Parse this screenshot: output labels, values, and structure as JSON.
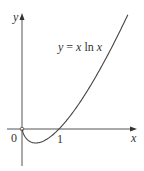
{
  "chart_data": {
    "type": "line",
    "title": "",
    "function_label": "y = x ln x",
    "xlabel": "x",
    "ylabel": "y",
    "x_ticks": [
      {
        "value": 0,
        "label": "0"
      },
      {
        "value": 1,
        "label": "1"
      }
    ],
    "xlim": [
      -0.4,
      3.1
    ],
    "ylim": [
      -1.0,
      3.0
    ],
    "grid": false,
    "legend": null,
    "series": [
      {
        "name": "y = x ln x",
        "x": [
          0.0,
          0.05,
          0.1,
          0.2,
          0.368,
          0.5,
          0.75,
          1.0,
          1.5,
          2.0,
          2.5,
          2.86
        ],
        "y": [
          0.0,
          -0.15,
          -0.23,
          -0.32,
          -0.368,
          -0.35,
          -0.22,
          0.0,
          0.61,
          1.39,
          2.29,
          3.0
        ]
      }
    ],
    "annotations": [
      {
        "text": "y = x ln x",
        "position": "upper middle, near curve"
      },
      {
        "text": "0",
        "position": "origin"
      },
      {
        "text": "1",
        "position": "x-intercept"
      }
    ]
  },
  "labels": {
    "y_axis": "y",
    "x_axis": "x",
    "origin": "0",
    "one": "1",
    "equation_lhs": "y",
    "equation_eq": " = ",
    "equation_x": "x",
    "equation_ln": " ln ",
    "equation_x2": "x"
  },
  "colors": {
    "axis": "#555555",
    "curve": "#444444",
    "text": "#333333"
  }
}
